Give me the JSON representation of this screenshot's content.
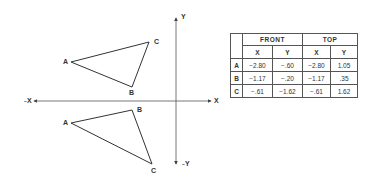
{
  "diagram": {
    "axes": {
      "x_positive_label": "X",
      "x_negative_label": "X",
      "y_positive_label": "Y",
      "y_negative_label": "Y",
      "origin_px": [
        176,
        101
      ],
      "x_range_px": [
        33,
        212
      ],
      "y_range_px": [
        18,
        164
      ],
      "line_color": "#444444"
    },
    "front_view_triangle": {
      "vertices": [
        {
          "label": "A",
          "px": [
            71,
            62
          ]
        },
        {
          "label": "B",
          "px": [
            132,
            87
          ]
        },
        {
          "label": "C",
          "px": [
            149,
            42
          ]
        }
      ]
    },
    "top_view_triangle": {
      "vertices": [
        {
          "label": "A",
          "px": [
            71,
            123
          ]
        },
        {
          "label": "B",
          "px": [
            132,
            110
          ]
        },
        {
          "label": "C",
          "px": [
            152,
            164
          ]
        }
      ]
    }
  },
  "table": {
    "groups": [
      "FRONT",
      "TOP"
    ],
    "subheaders": [
      "X",
      "Y",
      "X",
      "Y"
    ],
    "rows": [
      {
        "point": "A",
        "values": [
          "−2.80",
          "−.60",
          "−2.80",
          "1.05"
        ]
      },
      {
        "point": "B",
        "values": [
          "−1.17",
          "−.20",
          "−1.17",
          ".35"
        ]
      },
      {
        "point": "C",
        "values": [
          "−.61",
          "−1.62",
          "−.61",
          "1.62"
        ]
      }
    ]
  }
}
